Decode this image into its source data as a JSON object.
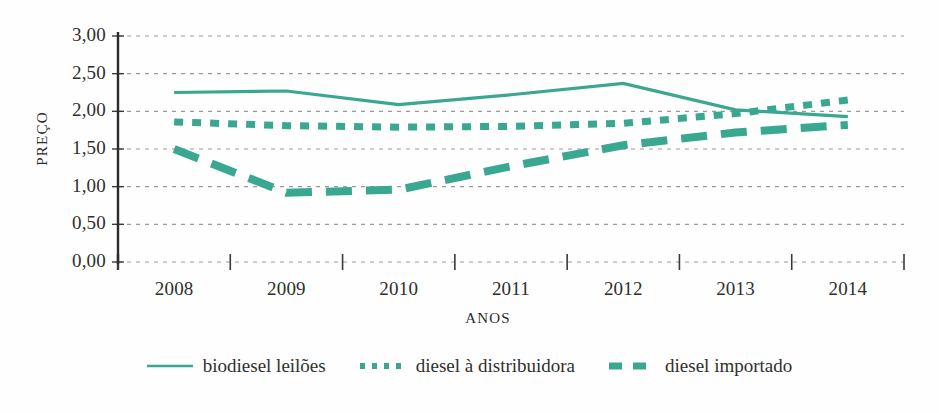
{
  "chart_data": {
    "type": "line",
    "title": "",
    "xlabel": "ANOS",
    "ylabel": "PREÇO",
    "categories": [
      "2008",
      "2009",
      "2010",
      "2011",
      "2012",
      "2013",
      "2014"
    ],
    "xlim": [
      2008,
      2014
    ],
    "ylim": [
      0.0,
      3.0
    ],
    "y_ticks": [
      "0,00",
      "0,50",
      "1,00",
      "1,50",
      "2,00",
      "2,50",
      "3,00"
    ],
    "y_tick_values": [
      0.0,
      0.5,
      1.0,
      1.5,
      2.0,
      2.5,
      3.0
    ],
    "grid": true,
    "legend_position": "bottom",
    "series": [
      {
        "name": "biodiesel leilões",
        "style": "solid",
        "color": "#3aa890",
        "values": [
          2.25,
          2.27,
          2.09,
          2.22,
          2.37,
          2.02,
          1.93
        ]
      },
      {
        "name": "diesel à distribuidora",
        "style": "dotted",
        "color": "#3aa890",
        "values": [
          1.86,
          1.81,
          1.79,
          1.8,
          1.84,
          1.97,
          2.15
        ]
      },
      {
        "name": "diesel importado",
        "style": "dashed",
        "color": "#3aa890",
        "values": [
          1.5,
          0.92,
          0.96,
          1.27,
          1.55,
          1.72,
          1.82
        ]
      }
    ]
  },
  "axes": {
    "y_title": "PREÇO",
    "x_title": "ANOS"
  },
  "legend": {
    "items": [
      {
        "label": "biodiesel leilões",
        "style": "solid"
      },
      {
        "label": "diesel à distribuidora",
        "style": "dotted"
      },
      {
        "label": "diesel importado",
        "style": "dashed"
      }
    ]
  },
  "colors": {
    "series": "#3aa890",
    "grid": "#9a9a9a",
    "axis": "#2b2b2b",
    "text": "#2f2f2f",
    "background": "#ffffff"
  }
}
